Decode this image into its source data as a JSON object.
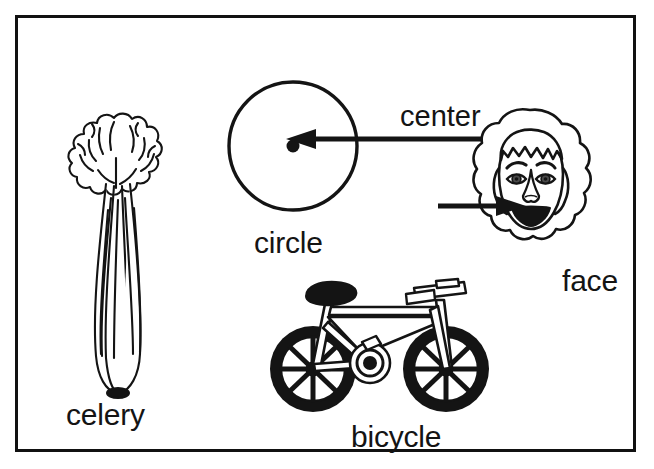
{
  "page": {
    "background_color": "#ffffff",
    "border_color": "#111111",
    "ink_color": "#141414",
    "type": "picture-vocabulary-worksheet"
  },
  "figures": [
    {
      "id": "celery",
      "label": "celery",
      "icon": "celery-icon",
      "description": "line drawing of a celery bunch with ruffled leaves on top and long ribbed stalks"
    },
    {
      "id": "circle",
      "label": "circle",
      "icon": "circle-icon",
      "description": "outline circle with a filled dot marking its center"
    },
    {
      "id": "face",
      "label": "face",
      "icon": "face-icon",
      "description": "line drawing of a smiling face with curly hair, eyes, eyebrows, nose and mouth"
    },
    {
      "id": "bicycle",
      "label": "bicycle",
      "icon": "bicycle-icon",
      "description": "line drawing of a bicycle with thick black tires, spoked wheels, frame, seat and handlebars"
    }
  ],
  "callouts": [
    {
      "id": "center",
      "label": "center",
      "points_to": "circle",
      "direction": "left"
    },
    {
      "id": "face-pointer",
      "label": "",
      "points_to": "face",
      "direction": "right"
    }
  ]
}
